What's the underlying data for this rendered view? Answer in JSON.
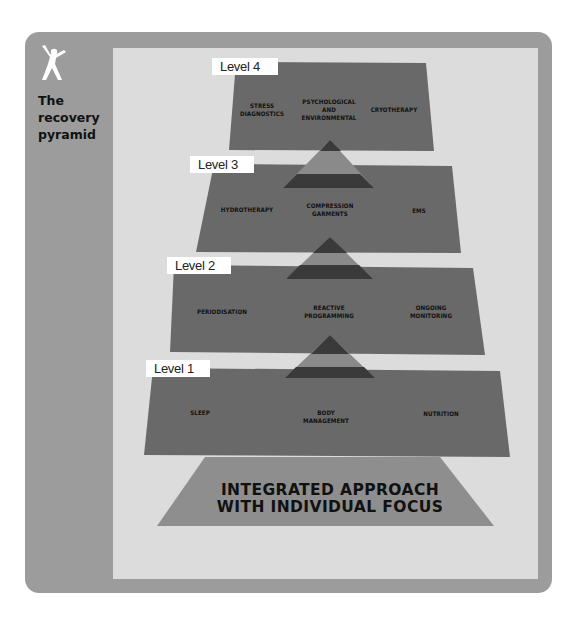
{
  "sidebar": {
    "icon": "person-jumping-icon",
    "title_lines": [
      "The",
      "recovery",
      "pyramid"
    ]
  },
  "colors": {
    "card": "#9c9c9c",
    "panel": "#dcdcdc",
    "level_fill": "#696969",
    "connector_light": "#8a8a8a",
    "connector_dark": "#3a3a3a",
    "base_fill": "#8e8e8e",
    "label_bg": "#ffffff"
  },
  "levels": [
    {
      "label": "Level 4",
      "items": [
        "STRESS\nDIAGNOSTICS",
        "PSYCHOLOGICAL\nAND\nENVIRONMENTAL",
        "CRYOTHERAPY"
      ]
    },
    {
      "label": "Level 3",
      "items": [
        "HYDROTHERAPY",
        "COMPRESSION\nGARMENTS",
        "EMS"
      ]
    },
    {
      "label": "Level 2",
      "items": [
        "PERIODISATION",
        "REACTIVE\nPROGRAMMING",
        "ONGOING\nMONITORING"
      ]
    },
    {
      "label": "Level 1",
      "items": [
        "SLEEP",
        "BODY\nMANAGEMENT",
        "NUTRITION"
      ]
    }
  ],
  "base": {
    "line1": "INTEGRATED APPROACH",
    "line2": "WITH INDIVIDUAL FOCUS"
  }
}
